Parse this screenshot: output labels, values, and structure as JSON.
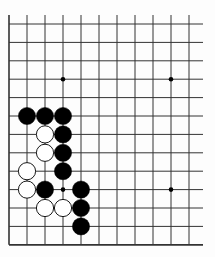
{
  "board": {
    "cols": 11,
    "rows": 13,
    "origin_x": 9,
    "origin_y": 24,
    "spacing_x": 18,
    "spacing_y": 18.4,
    "line_extend_right": 203,
    "line_extend_top": 15,
    "colors": {
      "background": "#fdfdfd",
      "line": "#333333",
      "black": "#000000",
      "white": "#ffffff"
    },
    "star_points": [
      [
        3,
        3
      ],
      [
        9,
        3
      ],
      [
        3,
        9
      ],
      [
        9,
        9
      ]
    ],
    "stones": [
      {
        "color": "black",
        "col": 1,
        "row": 5
      },
      {
        "color": "black",
        "col": 2,
        "row": 5
      },
      {
        "color": "black",
        "col": 3,
        "row": 5
      },
      {
        "color": "white",
        "col": 2,
        "row": 6
      },
      {
        "color": "black",
        "col": 3,
        "row": 6
      },
      {
        "color": "white",
        "col": 2,
        "row": 7
      },
      {
        "color": "black",
        "col": 3,
        "row": 7
      },
      {
        "color": "white",
        "col": 1,
        "row": 8
      },
      {
        "color": "black",
        "col": 3,
        "row": 8
      },
      {
        "color": "white",
        "col": 1,
        "row": 9
      },
      {
        "color": "black",
        "col": 2,
        "row": 9
      },
      {
        "color": "black",
        "col": 4,
        "row": 9
      },
      {
        "color": "white",
        "col": 2,
        "row": 10
      },
      {
        "color": "white",
        "col": 3,
        "row": 10
      },
      {
        "color": "black",
        "col": 4,
        "row": 10
      },
      {
        "color": "black",
        "col": 4,
        "row": 11
      }
    ]
  }
}
